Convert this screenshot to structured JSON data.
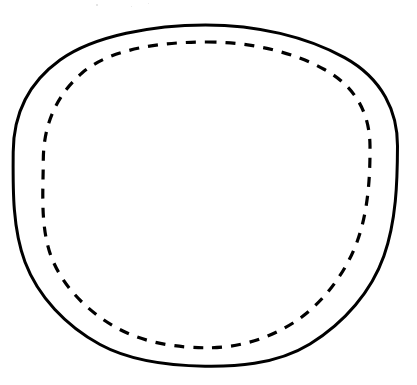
{
  "figure": {
    "background_color": "#ffffff",
    "ink_color": "#000000",
    "canvas": {
      "width": 417,
      "height": 385
    },
    "shapes": [
      {
        "id": "outer-circle",
        "name": "outer-solid-circle",
        "type": "ellipse",
        "style": "solid",
        "stroke_color": "#000000",
        "stroke_width": 3.0,
        "center_x": 205.5,
        "center_y": 195.5,
        "radius_x": 192.0,
        "radius_y": 170.5,
        "bounds": {
          "left": 13,
          "right": 398,
          "top": 25,
          "bottom": 366
        }
      },
      {
        "id": "inner-circle",
        "name": "inner-dashed-circle",
        "type": "ellipse",
        "style": "dashed",
        "stroke_color": "#000000",
        "stroke_width": 3.2,
        "center_x": 206.5,
        "center_y": 195.0,
        "radius_x": 163.5,
        "radius_y": 153.0,
        "dash_length": 10,
        "gap_length": 9,
        "bounds": {
          "left": 43,
          "right": 370,
          "top": 42,
          "bottom": 348
        }
      }
    ],
    "annotations": [],
    "labels": [],
    "specks": [
      {
        "x": 96,
        "y": 4,
        "size": 2,
        "color": "#dddddd"
      },
      {
        "x": 131,
        "y": 6,
        "size": 1,
        "color": "#e4e4e4"
      },
      {
        "x": 148,
        "y": 3,
        "size": 1,
        "color": "#e8e8e8"
      }
    ]
  }
}
